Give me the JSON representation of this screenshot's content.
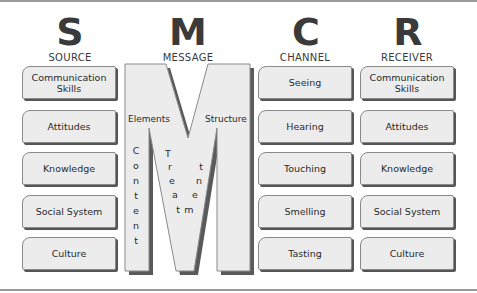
{
  "diagram": {
    "columns": [
      {
        "letter": "S",
        "label": "SOURCE",
        "items": [
          "Communication Skills",
          "Attitudes",
          "Knowledge",
          "Social System",
          "Culture"
        ]
      },
      {
        "letter": "M",
        "label": "MESSAGE",
        "labels": {
          "elements": "Elements",
          "structure": "Structure"
        },
        "vertical_words": {
          "content": "Content",
          "treatment": "Treatment"
        }
      },
      {
        "letter": "C",
        "label": "CHANNEL",
        "items": [
          "Seeing",
          "Hearing",
          "Touching",
          "Smelling",
          "Tasting"
        ]
      },
      {
        "letter": "R",
        "label": "RECEIVER",
        "items": [
          "Communication Skills",
          "Attitudes",
          "Knowledge",
          "Social System",
          "Culture"
        ]
      }
    ],
    "colors": {
      "box_fill": "#ececec",
      "box_border": "#8a8a8a",
      "shadow": "#555555",
      "rule": "#9a9a9a",
      "letter": "#3a3a3a"
    }
  }
}
